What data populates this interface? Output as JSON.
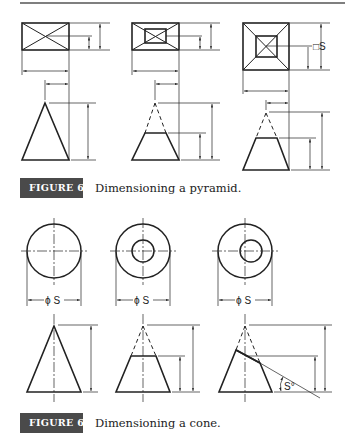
{
  "figures": [
    {
      "id": "6-87",
      "badge": "FIGURE 6-87",
      "caption": "Dimensioning a pyramid.",
      "annotations": {
        "square_size_label": "□S"
      }
    },
    {
      "id": "6-88",
      "badge": "FIGURE 6-88",
      "caption": "Dimensioning a cone.",
      "annotations": {
        "diameter_label_1": "ϕ S",
        "diameter_label_2": "ϕ S",
        "diameter_label_3": "ϕ S",
        "angle_label": "S°"
      }
    }
  ],
  "colors": {
    "ink": "#222222",
    "badge_bg": "#4a4a4a",
    "badge_text": "#ffffff",
    "rule": "#555555"
  }
}
